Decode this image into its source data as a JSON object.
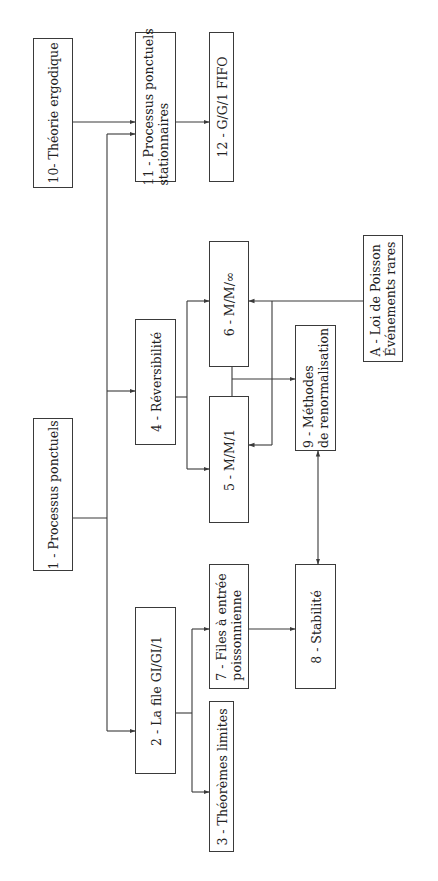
{
  "diagram": {
    "orientation": "rotated-90-ccw",
    "colors": {
      "line": "#3a3a3a",
      "text": "#222222",
      "background": "#ffffff"
    },
    "nodes": [
      {
        "id": "n1",
        "line1": "1 - Processus ponctuels",
        "line2": ""
      },
      {
        "id": "n2",
        "line1": "2 - La file GI/GI/1",
        "line2": ""
      },
      {
        "id": "n3",
        "line1": "3 - Théorèmes limites",
        "line2": ""
      },
      {
        "id": "n4",
        "line1": "4 - Réversibilité",
        "line2": ""
      },
      {
        "id": "n5",
        "line1": "5 - M/M/1",
        "line2": ""
      },
      {
        "id": "n6",
        "line1": "6 - M/M/∞",
        "line2": ""
      },
      {
        "id": "n7",
        "line1": "7 - Files à entrée",
        "line2": "poissonnienne"
      },
      {
        "id": "n8",
        "line1": "8 - Stabilité",
        "line2": ""
      },
      {
        "id": "n9",
        "line1": "9 - Méthodes",
        "line2": "de renormalisation"
      },
      {
        "id": "n10",
        "line1": "10- Théorie ergodique",
        "line2": ""
      },
      {
        "id": "n11",
        "line1": "11 - Processus ponctuels",
        "line2": "stationnaires"
      },
      {
        "id": "n12",
        "line1": "12 - G/G/1 FIFO",
        "line2": ""
      },
      {
        "id": "nA",
        "line1": "A - Loi de Poisson",
        "line2": "Événements rares"
      }
    ],
    "edges": [
      {
        "from": "1",
        "to": "11"
      },
      {
        "from": "1",
        "to": "4"
      },
      {
        "from": "1",
        "to": "2"
      },
      {
        "from": "10",
        "to": "11"
      },
      {
        "from": "11",
        "to": "12"
      },
      {
        "from": "4",
        "to": "6"
      },
      {
        "from": "4",
        "to": "5"
      },
      {
        "from": "A",
        "to": "6"
      },
      {
        "from": "A",
        "to": "5"
      },
      {
        "from": "5/6",
        "to": "9"
      },
      {
        "from": "9",
        "to": "8",
        "bidirectional": true
      },
      {
        "from": "2",
        "to": "7"
      },
      {
        "from": "2",
        "to": "3"
      },
      {
        "from": "7",
        "to": "8"
      }
    ]
  }
}
